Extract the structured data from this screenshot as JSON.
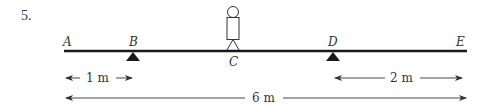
{
  "problem_number": "5.",
  "points": {
    "A": {
      "label": "A",
      "x": 64
    },
    "B": {
      "label": "B",
      "x": 133
    },
    "C": {
      "label": "C",
      "x": 233
    },
    "D": {
      "label": "D",
      "x": 333
    },
    "E": {
      "label": "E",
      "x": 467
    }
  },
  "beam": {
    "x1": 64,
    "x2": 467,
    "y": 51,
    "color": "#1a1a1a"
  },
  "supports": [
    {
      "name": "support-B",
      "at": "B",
      "type": "triangle-fulcrum"
    },
    {
      "name": "support-D",
      "at": "D",
      "type": "triangle-fulcrum"
    }
  ],
  "person": {
    "at": "C",
    "description": "stick figure standing on beam"
  },
  "dimensions": [
    {
      "name": "dim-AB",
      "from": "A",
      "to": "B",
      "label": "1 m",
      "y": 78
    },
    {
      "name": "dim-DE",
      "from": "D",
      "to": "E",
      "label": "2 m",
      "y": 78
    },
    {
      "name": "dim-AE",
      "from": "A",
      "to": "E",
      "label": "6 m",
      "y": 98
    }
  ]
}
